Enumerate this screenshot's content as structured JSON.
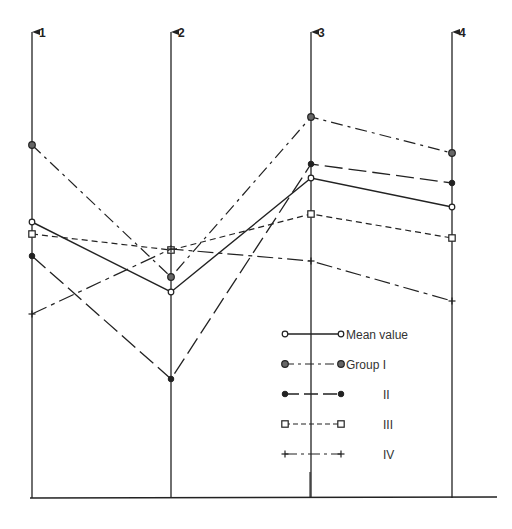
{
  "chart_data": {
    "type": "line",
    "subtype": "parallel-coordinates",
    "title": "",
    "xlabel": "",
    "ylabel": "",
    "categories": [
      "1",
      "2",
      "3",
      "4"
    ],
    "grid": false,
    "legend_position": "lower-right-inside",
    "note": "Values are relative vertical positions (0 = baseline, 100 = top of axis) read from the figure; no numeric scale is shown.",
    "ylim": [
      0,
      100
    ],
    "series": [
      {
        "name": "Mean value",
        "marker": "open-circle",
        "line": "solid",
        "values": [
          59,
          44,
          68,
          62
        ]
      },
      {
        "name": "Group I",
        "marker": "dotted-circle",
        "line": "dash-dot",
        "values": [
          76,
          47,
          82,
          74
        ]
      },
      {
        "name": "II",
        "marker": "filled-circle",
        "line": "long-dash",
        "values": [
          52,
          25,
          71,
          67
        ]
      },
      {
        "name": "III",
        "marker": "open-square",
        "line": "short-dash",
        "values": [
          56,
          53,
          61,
          55
        ]
      },
      {
        "name": "IV",
        "marker": "plus",
        "line": "dash-dot-long",
        "values": [
          39,
          53,
          51,
          42
        ]
      }
    ]
  },
  "axes": [
    {
      "label": "1",
      "x": 32
    },
    {
      "label": "2",
      "x": 171
    },
    {
      "label": "3",
      "x": 311
    },
    {
      "label": "4",
      "x": 452
    }
  ],
  "legend": [
    {
      "label": "Mean value",
      "indent": false
    },
    {
      "label": "Group I",
      "indent": false
    },
    {
      "label": "II",
      "indent": true
    },
    {
      "label": "III",
      "indent": true
    },
    {
      "label": "IV",
      "indent": true
    }
  ],
  "colors": {
    "ink": "#222222",
    "background": "#ffffff"
  }
}
